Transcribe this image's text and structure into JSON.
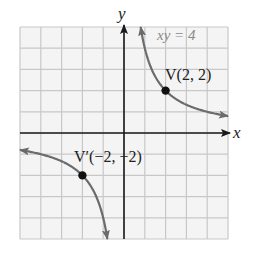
{
  "chart_data": {
    "type": "line",
    "title": "",
    "xlabel": "x",
    "ylabel": "y",
    "xlim": [
      -5,
      5
    ],
    "ylim": [
      -5,
      5
    ],
    "grid": true,
    "grid_step": 1,
    "legend": null,
    "series": [
      {
        "name": "xy = 4",
        "equation": "xy = 4",
        "branches": [
          {
            "x": [
              0.8,
              1,
              1.25,
              1.5,
              2,
              2.5,
              3,
              4,
              5
            ],
            "y": [
              5,
              4,
              3.2,
              2.667,
              2,
              1.6,
              1.333,
              1,
              0.8
            ]
          },
          {
            "x": [
              -5,
              -4,
              -3,
              -2.5,
              -2,
              -1.5,
              -1.25,
              -1,
              -0.8
            ],
            "y": [
              -0.8,
              -1,
              -1.333,
              -1.6,
              -2,
              -2.667,
              -3.2,
              -4,
              -5
            ]
          }
        ],
        "color": "#6b6b6b"
      }
    ],
    "points": [
      {
        "label": "V(2, 2)",
        "x": 2,
        "y": 2
      },
      {
        "label": "V′(−2, −2)",
        "x": -2,
        "y": -2
      }
    ],
    "annotations": [
      "xy = 4"
    ]
  },
  "labels": {
    "x_axis": "x",
    "y_axis": "y",
    "equation": "xy = 4",
    "vertex": "V(2, 2)",
    "vertex_prime": "V′(−2, −2)"
  },
  "colors": {
    "grid": "#c8c8c8",
    "axis": "#1a1a1a",
    "curve": "#6b6b6b",
    "point": "#111111",
    "background": "#f4f4f4"
  }
}
